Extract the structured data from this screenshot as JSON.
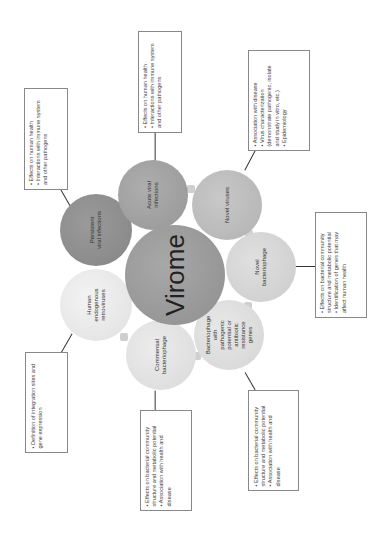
{
  "title": "Virome",
  "colors": {
    "virome": "#9a9a9a",
    "persistent": "#8e8e8e",
    "acute": "#a2a2a2",
    "novel_viruses": "#bdbdbd",
    "novel_bacteriophage": "#d6d6d6",
    "bacteriophage_pathogenic": "#dedede",
    "commensal": "#e3e3e3",
    "herv": "#ececec"
  },
  "nodes": {
    "persistent": "Persistent\nviral infections",
    "acute": "Acute viral\ninfections",
    "novel_viruses": "Novel viruses",
    "novel_bacteriophage": "Novel\nbacteriophage",
    "bacteriophage_pathogenic": "Bacteriophage\nwith\npathogenic\npotential or\nantibiotic\nresistance\ngenes",
    "commensal": "Commensal\nbacteriophage",
    "herv": "Human\nendogenous\nretroviruses"
  },
  "boxes": {
    "persistent": [
      "• Effects on human health",
      "• Interactions with immune system and other pathogens"
    ],
    "acute": [
      "• Effects on human health",
      "• Interactions with immune system and other pathogens"
    ],
    "novel_viruses": [
      "• Association with disease",
      "• Virus characterization (demonstrate pathogenic, isolate and study in vitro, etc.)",
      "• Epidemiology"
    ],
    "novel_bacteriophage": [
      "• Effects on bacterial community structure and metabolic potential",
      "• Identification of genes that may affect human health"
    ],
    "bacteriophage_pathogenic": [
      "• Effects on bacterial community structure and metabolic potential",
      "• Association with health and disease"
    ],
    "commensal": [
      "• Effects on bacterial community structure and metabolic potential",
      "• Association with health and disease"
    ],
    "herv": [
      "• Definition of integration sites and gene expression"
    ]
  }
}
